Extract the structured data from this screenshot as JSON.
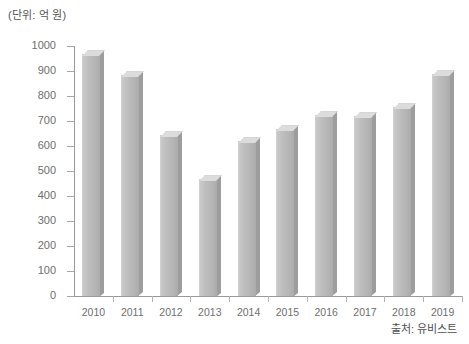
{
  "unit_label": "(단위: 억 원)",
  "source_label": "출처: 유비스트",
  "chart_data": {
    "type": "bar",
    "title": "",
    "subtitle": "",
    "xlabel": "",
    "ylabel": "(단위: 억 원)",
    "categories": [
      "2010",
      "2011",
      "2012",
      "2013",
      "2014",
      "2015",
      "2016",
      "2017",
      "2018",
      "2019"
    ],
    "values": [
      970,
      885,
      645,
      470,
      620,
      670,
      725,
      720,
      755,
      890
    ],
    "ylim": [
      0,
      1000
    ],
    "yticks": [
      0,
      100,
      200,
      300,
      400,
      500,
      600,
      700,
      800,
      900,
      1000
    ],
    "ytick_labels": [
      "0",
      "100",
      "200",
      "300",
      "400",
      "500",
      "600",
      "700",
      "800",
      "900",
      "1000"
    ],
    "grid": false,
    "legend": null,
    "series": [
      {
        "name": "연도별 금액",
        "values": [
          970,
          885,
          645,
          470,
          620,
          670,
          725,
          720,
          755,
          890
        ]
      }
    ],
    "bar_color": "#b9b9b9",
    "bar_top_color": "#dcdcdc",
    "bar_side_color": "#9d9d9d",
    "axis_color": "#9a9a9a",
    "text_color": "#6e6e6e",
    "background": "#ffffff",
    "annotations": [
      "(단위: 억 원)",
      "출처: 유비스트"
    ]
  }
}
